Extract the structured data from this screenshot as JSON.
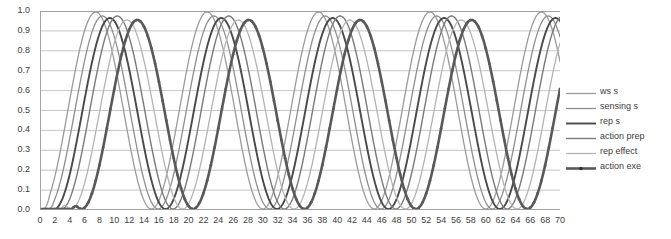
{
  "chart_data": {
    "type": "line",
    "title": "",
    "xlabel": "",
    "ylabel": "",
    "xlim": [
      0,
      70
    ],
    "ylim": [
      0,
      1.0
    ],
    "grid": "horizontal",
    "legend_position": "right",
    "x_ticks": [
      0,
      2,
      4,
      6,
      8,
      10,
      12,
      14,
      16,
      18,
      20,
      22,
      24,
      26,
      28,
      30,
      32,
      34,
      36,
      38,
      40,
      42,
      44,
      46,
      48,
      50,
      52,
      54,
      56,
      58,
      60,
      62,
      64,
      66,
      68,
      70
    ],
    "x_minor_tick_step": 1,
    "y_ticks": [
      "0.0",
      "0.1",
      "0.2",
      "0.3",
      "0.4",
      "0.5",
      "0.6",
      "0.7",
      "0.8",
      "0.9",
      "1.0"
    ],
    "series": [
      {
        "name": "ws s",
        "color": "#9b9b9b",
        "width": 1.3,
        "marker": "none",
        "onset": 0.3,
        "phase": 0.0,
        "period": 15.0,
        "amplitude": 0.495,
        "offset": 0.5,
        "peak": 0.995,
        "trough": 0.005
      },
      {
        "name": "sensing s",
        "color": "#8f8f8f",
        "width": 1.3,
        "marker": "none",
        "onset": 0.9,
        "phase": 0.9,
        "period": 15.0,
        "amplitude": 0.485,
        "offset": 0.49,
        "peak": 0.975,
        "trough": 0.005
      },
      {
        "name": "rep s",
        "color": "#4a4a4a",
        "width": 1.9,
        "marker": "none",
        "onset": 1.5,
        "phase": 1.9,
        "period": 15.0,
        "amplitude": 0.48,
        "offset": 0.485,
        "peak": 0.965,
        "trough": 0.005
      },
      {
        "name": "action prep",
        "color": "#7a7a7a",
        "width": 1.4,
        "marker": "none",
        "onset": 2.1,
        "phase": 2.9,
        "period": 15.0,
        "amplitude": 0.485,
        "offset": 0.49,
        "peak": 0.975,
        "trough": 0.005
      },
      {
        "name": "rep effect",
        "color": "#b4b4b4",
        "width": 1.3,
        "marker": "none",
        "onset": 2.7,
        "phase": 4.2,
        "period": 15.0,
        "amplitude": 0.475,
        "offset": 0.48,
        "peak": 0.955,
        "trough": 0.005
      },
      {
        "name": "action exe",
        "color": "#595959",
        "width": 2.6,
        "marker": "dot",
        "onset": 4.2,
        "phase": 5.6,
        "period": 15.0,
        "amplitude": 0.475,
        "offset": 0.48,
        "peak": 0.955,
        "trough": 0.005
      }
    ]
  },
  "axes": {
    "grid_color": "#b7b7b7",
    "frame_color": "#9a9a9a",
    "tick_color": "#9a9a9a",
    "label_color": "#404040"
  }
}
